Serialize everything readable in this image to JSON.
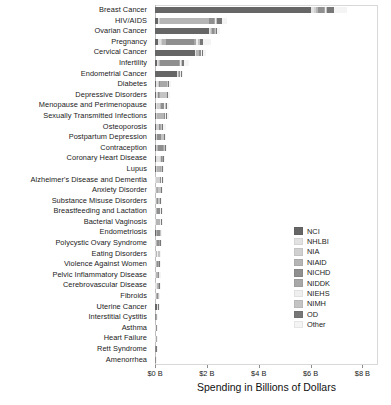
{
  "chart_data": {
    "type": "bar",
    "orientation": "horizontal",
    "stacked": true,
    "title": "",
    "xlabel": "Spending in Billions of Dollars",
    "ylabel": "",
    "xlim": [
      0,
      8.6
    ],
    "xticks": [
      0,
      2,
      4,
      6,
      8
    ],
    "xtick_labels": [
      "$0 B",
      "$2 B",
      "$4 B",
      "$6 B",
      "$8 B"
    ],
    "grid": false,
    "legend_position": "center-right",
    "series": [
      {
        "name": "NCI",
        "color": "#666666"
      },
      {
        "name": "NHLBI",
        "color": "#e2e2e2"
      },
      {
        "name": "NIA",
        "color": "#d0d0d0"
      },
      {
        "name": "NIAID",
        "color": "#b5b5b5"
      },
      {
        "name": "NICHD",
        "color": "#8f8f8f"
      },
      {
        "name": "NIDDK",
        "color": "#a8a8a8"
      },
      {
        "name": "NIEHS",
        "color": "#efefef"
      },
      {
        "name": "NIMH",
        "color": "#c4c4c4"
      },
      {
        "name": "OD",
        "color": "#777777"
      },
      {
        "name": "Other",
        "color": "#f4f4f4"
      }
    ],
    "categories": [
      "Breast Cancer",
      "HIV/AIDS",
      "Ovarian Cancer",
      "Pregnancy",
      "Cervical Cancer",
      "Infertility",
      "Endometrial Cancer",
      "Diabetes",
      "Depressive Disorders",
      "Menopause and Perimenopause",
      "Sexually Transmitted Infections",
      "Osteoporosis",
      "Postpartum Depression",
      "Contraception",
      "Coronary Heart Disease",
      "Lupus",
      "Alzheimer's Disease and Dementia",
      "Anxiety Disorder",
      "Substance Misuse Disorders",
      "Breastfeeding and Lactation",
      "Bacterial Vaginosis",
      "Endometriosis",
      "Polycystic Ovary Syndrome",
      "Eating Disorders",
      "Violence Against Women",
      "Pelvic Inflammatory Disease",
      "Cerebrovascular Disease",
      "Fibroids",
      "Uterine Cancer",
      "Interstitial Cystitis",
      "Asthma",
      "Heart Failure",
      "Rett Syndrome",
      "Amenorrhea"
    ],
    "rows": [
      {
        "category": "Breast Cancer",
        "total": 7.4,
        "values": [
          6.0,
          0.12,
          0.1,
          0.06,
          0.22,
          0.05,
          0.04,
          0.05,
          0.26,
          0.5
        ]
      },
      {
        "category": "HIV/AIDS",
        "total": 2.78,
        "values": [
          0.1,
          0.06,
          0.04,
          1.9,
          0.18,
          0.04,
          0.03,
          0.06,
          0.17,
          0.2
        ]
      },
      {
        "category": "Ovarian Cancer",
        "total": 2.5,
        "values": [
          2.1,
          0.04,
          0.03,
          0.03,
          0.08,
          0.03,
          0.02,
          0.02,
          0.06,
          0.09
        ]
      },
      {
        "category": "Pregnancy",
        "total": 2.16,
        "values": [
          0.12,
          0.1,
          0.05,
          0.15,
          1.1,
          0.08,
          0.06,
          0.06,
          0.14,
          0.3
        ]
      },
      {
        "category": "Cervical Cancer",
        "total": 1.96,
        "values": [
          1.55,
          0.03,
          0.02,
          0.1,
          0.06,
          0.02,
          0.02,
          0.02,
          0.05,
          0.09
        ]
      },
      {
        "category": "Infertility",
        "total": 1.3,
        "values": [
          0.08,
          0.04,
          0.03,
          0.05,
          0.72,
          0.05,
          0.03,
          0.03,
          0.1,
          0.17
        ]
      },
      {
        "category": "Endometrial Cancer",
        "total": 1.05,
        "values": [
          0.86,
          0.02,
          0.02,
          0.01,
          0.04,
          0.02,
          0.01,
          0.01,
          0.03,
          0.03
        ]
      },
      {
        "category": "Diabetes",
        "total": 0.62,
        "values": [
          0.04,
          0.06,
          0.04,
          0.03,
          0.04,
          0.25,
          0.02,
          0.02,
          0.05,
          0.07
        ]
      },
      {
        "category": "Depressive Disorders",
        "total": 0.58,
        "values": [
          0.03,
          0.03,
          0.05,
          0.02,
          0.04,
          0.02,
          0.02,
          0.25,
          0.05,
          0.07
        ]
      },
      {
        "category": "Menopause and Perimenopause",
        "total": 0.55,
        "values": [
          0.04,
          0.04,
          0.12,
          0.02,
          0.11,
          0.03,
          0.02,
          0.03,
          0.06,
          0.08
        ]
      },
      {
        "category": "Sexually Transmitted Infections",
        "total": 0.52,
        "values": [
          0.03,
          0.02,
          0.02,
          0.26,
          0.05,
          0.02,
          0.01,
          0.02,
          0.04,
          0.05
        ]
      },
      {
        "category": "Osteoporosis",
        "total": 0.4,
        "values": [
          0.02,
          0.03,
          0.1,
          0.01,
          0.03,
          0.03,
          0.02,
          0.01,
          0.05,
          0.1
        ]
      },
      {
        "category": "Postpartum Depression",
        "total": 0.42,
        "values": [
          0.02,
          0.02,
          0.02,
          0.01,
          0.14,
          0.01,
          0.01,
          0.12,
          0.03,
          0.04
        ]
      },
      {
        "category": "Contraception",
        "total": 0.45,
        "values": [
          0.02,
          0.02,
          0.02,
          0.04,
          0.22,
          0.02,
          0.01,
          0.02,
          0.04,
          0.04
        ]
      },
      {
        "category": "Coronary Heart Disease",
        "total": 0.38,
        "values": [
          0.02,
          0.18,
          0.03,
          0.01,
          0.02,
          0.03,
          0.01,
          0.01,
          0.03,
          0.04
        ]
      },
      {
        "category": "Lupus",
        "total": 0.32,
        "values": [
          0.02,
          0.02,
          0.02,
          0.12,
          0.02,
          0.03,
          0.02,
          0.01,
          0.03,
          0.03
        ]
      },
      {
        "category": "Alzheimer's Disease and Dementia",
        "total": 0.3,
        "values": [
          0.01,
          0.02,
          0.16,
          0.01,
          0.02,
          0.01,
          0.01,
          0.02,
          0.02,
          0.02
        ]
      },
      {
        "category": "Anxiety Disorder",
        "total": 0.28,
        "values": [
          0.01,
          0.01,
          0.02,
          0.01,
          0.02,
          0.01,
          0.01,
          0.13,
          0.03,
          0.03
        ]
      },
      {
        "category": "Substance Misuse Disorders",
        "total": 0.26,
        "values": [
          0.01,
          0.02,
          0.02,
          0.02,
          0.03,
          0.01,
          0.01,
          0.05,
          0.04,
          0.05
        ]
      },
      {
        "category": "Breastfeeding and Lactation",
        "total": 0.25,
        "values": [
          0.01,
          0.01,
          0.01,
          0.01,
          0.13,
          0.01,
          0.01,
          0.01,
          0.02,
          0.03
        ]
      },
      {
        "category": "Bacterial Vaginosis",
        "total": 0.24,
        "values": [
          0.01,
          0.01,
          0.01,
          0.13,
          0.02,
          0.01,
          0.01,
          0.01,
          0.02,
          0.01
        ]
      },
      {
        "category": "Endometriosis",
        "total": 0.22,
        "values": [
          0.02,
          0.01,
          0.01,
          0.01,
          0.11,
          0.01,
          0.01,
          0.01,
          0.02,
          0.01
        ]
      },
      {
        "category": "Polycystic Ovary Syndrome",
        "total": 0.21,
        "values": [
          0.01,
          0.01,
          0.01,
          0.01,
          0.09,
          0.03,
          0.01,
          0.01,
          0.02,
          0.01
        ]
      },
      {
        "category": "Eating Disorders",
        "total": 0.19,
        "values": [
          0.01,
          0.01,
          0.01,
          0.01,
          0.02,
          0.01,
          0.01,
          0.08,
          0.02,
          0.01
        ]
      },
      {
        "category": "Violence Against Women",
        "total": 0.18,
        "values": [
          0.01,
          0.01,
          0.01,
          0.01,
          0.06,
          0.01,
          0.01,
          0.02,
          0.03,
          0.01
        ]
      },
      {
        "category": "Pelvic Inflammatory Disease",
        "total": 0.17,
        "values": [
          0.01,
          0.01,
          0.01,
          0.08,
          0.02,
          0.01,
          0.01,
          0.01,
          0.01,
          0.01
        ]
      },
      {
        "category": "Cerebrovascular Disease",
        "total": 0.16,
        "values": [
          0.01,
          0.05,
          0.03,
          0.01,
          0.01,
          0.01,
          0.01,
          0.01,
          0.01,
          0.01
        ]
      },
      {
        "category": "Fibroids",
        "total": 0.12,
        "values": [
          0.01,
          0.01,
          0.01,
          0.01,
          0.04,
          0.01,
          0.01,
          0.01,
          0.01,
          0.01
        ]
      },
      {
        "category": "Uterine Cancer",
        "total": 0.14,
        "values": [
          0.09,
          0.01,
          0.0,
          0.0,
          0.01,
          0.0,
          0.0,
          0.0,
          0.01,
          0.02
        ]
      },
      {
        "category": "Interstitial Cystitis",
        "total": 0.1,
        "values": [
          0.01,
          0.0,
          0.0,
          0.0,
          0.01,
          0.05,
          0.0,
          0.0,
          0.01,
          0.02
        ]
      },
      {
        "category": "Asthma",
        "total": 0.09,
        "values": [
          0.0,
          0.03,
          0.0,
          0.02,
          0.01,
          0.0,
          0.01,
          0.0,
          0.01,
          0.01
        ]
      },
      {
        "category": "Heart Failure",
        "total": 0.07,
        "values": [
          0.0,
          0.03,
          0.01,
          0.0,
          0.0,
          0.01,
          0.0,
          0.0,
          0.01,
          0.01
        ]
      },
      {
        "category": "Rett Syndrome",
        "total": 0.06,
        "values": [
          0.0,
          0.0,
          0.0,
          0.0,
          0.03,
          0.0,
          0.0,
          0.01,
          0.01,
          0.01
        ]
      },
      {
        "category": "Amenorrhea",
        "total": 0.05,
        "values": [
          0.0,
          0.0,
          0.0,
          0.0,
          0.02,
          0.0,
          0.0,
          0.0,
          0.01,
          0.02
        ]
      }
    ]
  }
}
